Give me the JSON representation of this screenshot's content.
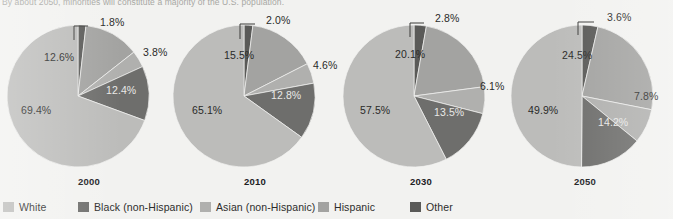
{
  "caption": "By about 2050, minorities will constitute a majority of the U.S. population.",
  "legend": {
    "items": [
      {
        "label": "White",
        "color": "#bcbcba",
        "x": 3
      },
      {
        "label": "Black (non-Hispanic)",
        "color": "#6e6e6c",
        "x": 78
      },
      {
        "label": "Asian (non-Hispanic)",
        "color": "#b0b0ae",
        "x": 200
      },
      {
        "label": "Hispanic",
        "color": "#a3a3a1",
        "x": 318
      },
      {
        "label": "Other",
        "color": "#5a5a58",
        "x": 410
      }
    ]
  },
  "chart_data": {
    "type": "pie",
    "title": "By about 2050, minorities will constitute a majority of the U.S. population.",
    "legend_position": "bottom",
    "categories": [
      "Other",
      "Hispanic",
      "Asian (non-Hispanic)",
      "Black (non-Hispanic)",
      "White"
    ],
    "colors": {
      "White": "#bcbcba",
      "Black (non-Hispanic)": "#6e6e6c",
      "Asian (non-Hispanic)": "#b0b0ae",
      "Hispanic": "#a3a3a1",
      "Other": "#5a5a58"
    },
    "charts": [
      {
        "year": "2000",
        "values": {
          "Other": 1.8,
          "Hispanic": 12.6,
          "Asian (non-Hispanic)": 3.8,
          "Black (non-Hispanic)": 12.4,
          "White": 69.4
        },
        "labels": [
          "1.8%",
          "12.6%",
          "3.8%",
          "12.4%",
          "69.4%"
        ]
      },
      {
        "year": "2010",
        "values": {
          "Other": 2.0,
          "Hispanic": 15.5,
          "Asian (non-Hispanic)": 4.6,
          "Black (non-Hispanic)": 12.8,
          "White": 65.1
        },
        "labels": [
          "2.0%",
          "15.5%",
          "4.6%",
          "12.8%",
          "65.1%"
        ]
      },
      {
        "year": "2030",
        "values": {
          "Other": 2.8,
          "Hispanic": 20.1,
          "Asian (non-Hispanic)": 6.1,
          "Black (non-Hispanic)": 13.5,
          "White": 57.5
        },
        "labels": [
          "2.8%",
          "20.1%",
          "6.1%",
          "13.5%",
          "57.5%"
        ]
      },
      {
        "year": "2050",
        "values": {
          "Other": 3.6,
          "Hispanic": 24.5,
          "Asian (non-Hispanic)": 7.8,
          "Black (non-Hispanic)": 14.2,
          "White": 49.9
        },
        "labels": [
          "3.6%",
          "24.5%",
          "7.8%",
          "14.2%",
          "49.9%"
        ]
      }
    ]
  },
  "pies": [
    {
      "year": "2000",
      "left": 4,
      "cx": 74,
      "cy": 90,
      "r": 71,
      "slices": [
        {
          "key": "Other",
          "value": 1.8,
          "label": "1.8%",
          "lx": 96,
          "ly": 10,
          "cls": "outside",
          "leader": "M 70 20 L 84 20 M 70 20 L 70 34"
        },
        {
          "key": "Hispanic",
          "value": 12.6,
          "label": "12.6%",
          "lx": 40,
          "ly": 45,
          "cls": "inside-light"
        },
        {
          "key": "Asian",
          "value": 3.8,
          "label": "3.8%",
          "lx": 139,
          "ly": 40,
          "cls": "outside",
          "leader": null
        },
        {
          "key": "Black",
          "value": 12.4,
          "label": "12.4%",
          "lx": 102,
          "ly": 78,
          "cls": "inside-dark"
        },
        {
          "key": "White",
          "value": 69.4,
          "label": "69.4%",
          "lx": 17,
          "ly": 98,
          "cls": "inside-light"
        }
      ]
    },
    {
      "year": "2010",
      "left": 170,
      "cx": 74,
      "cy": 90,
      "r": 71,
      "slices": [
        {
          "key": "Other",
          "value": 2.0,
          "label": "2.0%",
          "lx": 96,
          "ly": 8,
          "cls": "outside",
          "leader": "M 70 18 L 85 18 M 70 18 L 70 33"
        },
        {
          "key": "Hispanic",
          "value": 15.5,
          "label": "15.5%",
          "lx": 54,
          "ly": 43,
          "cls": "inside-light"
        },
        {
          "key": "Asian",
          "value": 4.6,
          "label": "4.6%",
          "lx": 143,
          "ly": 53,
          "cls": "outside",
          "leader": null
        },
        {
          "key": "Black",
          "value": 12.8,
          "label": "12.8%",
          "lx": 101,
          "ly": 83,
          "cls": "inside-dark"
        },
        {
          "key": "White",
          "value": 65.1,
          "label": "65.1%",
          "lx": 22,
          "ly": 98,
          "cls": "inside-light"
        }
      ]
    },
    {
      "year": "2030",
      "left": 336,
      "cx": 78,
      "cy": 90,
      "r": 71,
      "slices": [
        {
          "key": "Other",
          "value": 2.8,
          "label": "2.8%",
          "lx": 99,
          "ly": 6,
          "cls": "outside",
          "leader": "M 74 17 L 88 17 M 74 17 L 74 31"
        },
        {
          "key": "Hispanic",
          "value": 20.1,
          "label": "20.1%",
          "lx": 59,
          "ly": 42,
          "cls": "inside-light"
        },
        {
          "key": "Asian",
          "value": 6.1,
          "label": "6.1%",
          "lx": 144,
          "ly": 74,
          "cls": "inside-light"
        },
        {
          "key": "Black",
          "value": 13.5,
          "label": "13.5%",
          "lx": 98,
          "ly": 100,
          "cls": "inside-dark"
        },
        {
          "key": "White",
          "value": 57.5,
          "label": "57.5%",
          "lx": 24,
          "ly": 98,
          "cls": "inside-light"
        }
      ]
    },
    {
      "year": "2050",
      "left": 500,
      "cx": 82,
      "cy": 90,
      "r": 71,
      "slices": [
        {
          "key": "Other",
          "value": 3.6,
          "label": "3.6%",
          "lx": 107,
          "ly": 5,
          "cls": "outside",
          "leader": "M 78 16 L 94 16 M 78 16 L 78 29"
        },
        {
          "key": "Hispanic",
          "value": 24.5,
          "label": "24.5%",
          "lx": 62,
          "ly": 43,
          "cls": "inside-light"
        },
        {
          "key": "Asian",
          "value": 7.8,
          "label": "7.8%",
          "lx": 134,
          "ly": 84,
          "cls": "inside-light"
        },
        {
          "key": "Black",
          "value": 14.2,
          "label": "14.2%",
          "lx": 98,
          "ly": 110,
          "cls": "inside-dark"
        },
        {
          "key": "White",
          "value": 49.9,
          "label": "49.9%",
          "lx": 28,
          "ly": 98,
          "cls": "inside-light"
        }
      ]
    }
  ]
}
